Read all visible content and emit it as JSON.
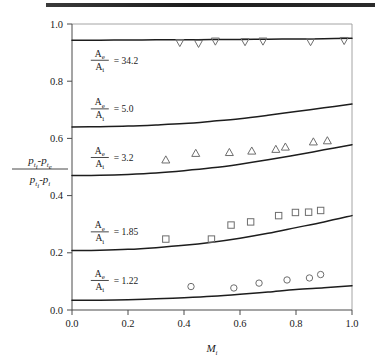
{
  "figure": {
    "name": "nozzle-total-pressure-loss-chart"
  },
  "chart_data": {
    "type": "line",
    "title": "",
    "xlabel": "M_i",
    "ylabel": "(p_ti - p_te) / (p_ti - p_i)",
    "xlim": [
      0.0,
      1.0
    ],
    "ylim": [
      0.0,
      1.0
    ],
    "grid": false,
    "legend_position": "inline-curve-labels",
    "xticks": [
      "0.0",
      "0.2",
      "0.4",
      "0.6",
      "0.8",
      "1.0"
    ],
    "xtick_values": [
      0.0,
      0.2,
      0.4,
      0.6,
      0.8,
      1.0
    ],
    "yticks": [
      "0.0",
      "0.2",
      "0.4",
      "0.6",
      "0.8",
      "1.0"
    ],
    "ytick_values": [
      0.0,
      0.2,
      0.4,
      0.6,
      0.8,
      1.0
    ],
    "series": [
      {
        "name": "Ae/Ai = 34.2",
        "label_numerator": "A",
        "label_num_sub": "e",
        "label_denominator": "A",
        "label_den_sub": "i",
        "label_value": "= 34.2",
        "ratio": "34.2",
        "label_x": 0.06,
        "label_y": 0.875,
        "curve_x": [
          0.0,
          0.1,
          0.2,
          0.3,
          0.4,
          0.5,
          0.6,
          0.7,
          0.8,
          0.9,
          1.0
        ],
        "curve_y": [
          0.943,
          0.9435,
          0.944,
          0.9445,
          0.945,
          0.9455,
          0.946,
          0.9468,
          0.9475,
          0.9485,
          0.95
        ],
        "marker": "triangle-down",
        "points_x": [
          0.385,
          0.452,
          0.512,
          0.618,
          0.682,
          0.852,
          0.972
        ],
        "points_y": [
          0.935,
          0.932,
          0.94,
          0.938,
          0.94,
          0.938,
          0.942
        ]
      },
      {
        "name": "Ae/Ai = 5.0",
        "label_numerator": "A",
        "label_num_sub": "e",
        "label_denominator": "A",
        "label_den_sub": "i",
        "label_value": "= 5.0",
        "ratio": "5.0",
        "label_x": 0.06,
        "label_y": 0.705,
        "curve_x": [
          0.0,
          0.1,
          0.2,
          0.3,
          0.4,
          0.5,
          0.6,
          0.7,
          0.8,
          0.9,
          1.0
        ],
        "curve_y": [
          0.64,
          0.641,
          0.643,
          0.647,
          0.652,
          0.66,
          0.669,
          0.681,
          0.694,
          0.707,
          0.72
        ],
        "marker": "none",
        "points_x": [],
        "points_y": []
      },
      {
        "name": "Ae/Ai = 3.2",
        "label_numerator": "A",
        "label_num_sub": "e",
        "label_denominator": "A",
        "label_den_sub": "i",
        "label_value": "= 3.2",
        "ratio": "3.2",
        "label_x": 0.06,
        "label_y": 0.535,
        "curve_x": [
          0.0,
          0.1,
          0.2,
          0.3,
          0.4,
          0.5,
          0.6,
          0.7,
          0.8,
          0.9,
          1.0
        ],
        "curve_y": [
          0.47,
          0.471,
          0.474,
          0.479,
          0.487,
          0.497,
          0.51,
          0.525,
          0.542,
          0.56,
          0.578
        ],
        "marker": "triangle-up",
        "points_x": [
          0.335,
          0.442,
          0.562,
          0.642,
          0.728,
          0.762,
          0.862,
          0.912
        ],
        "points_y": [
          0.525,
          0.548,
          0.551,
          0.556,
          0.562,
          0.57,
          0.588,
          0.592
        ]
      },
      {
        "name": "Ae/Ai = 1.85",
        "label_numerator": "A",
        "label_num_sub": "e",
        "label_denominator": "A",
        "label_den_sub": "i",
        "label_value": "= 1.85",
        "ratio": "1.85",
        "label_x": 0.06,
        "label_y": 0.275,
        "curve_x": [
          0.0,
          0.1,
          0.2,
          0.3,
          0.4,
          0.5,
          0.6,
          0.7,
          0.8,
          0.9,
          1.0
        ],
        "curve_y": [
          0.208,
          0.209,
          0.212,
          0.218,
          0.226,
          0.237,
          0.251,
          0.268,
          0.288,
          0.308,
          0.33
        ],
        "marker": "square",
        "points_x": [
          0.335,
          0.498,
          0.568,
          0.638,
          0.738,
          0.798,
          0.845,
          0.888
        ],
        "points_y": [
          0.248,
          0.248,
          0.297,
          0.308,
          0.33,
          0.341,
          0.342,
          0.348
        ]
      },
      {
        "name": "Ae/Ai = 1.22",
        "label_numerator": "A",
        "label_num_sub": "e",
        "label_denominator": "A",
        "label_den_sub": "i",
        "label_value": "= 1.22",
        "ratio": "1.22",
        "label_x": 0.06,
        "label_y": 0.105,
        "curve_x": [
          0.0,
          0.1,
          0.2,
          0.3,
          0.4,
          0.5,
          0.6,
          0.7,
          0.8,
          0.9,
          1.0
        ],
        "curve_y": [
          0.034,
          0.0345,
          0.036,
          0.039,
          0.043,
          0.048,
          0.055,
          0.063,
          0.072,
          0.078,
          0.085
        ],
        "marker": "circle",
        "points_x": [
          0.425,
          0.578,
          0.668,
          0.768,
          0.848,
          0.888
        ],
        "points_y": [
          0.082,
          0.077,
          0.094,
          0.105,
          0.112,
          0.124
        ]
      }
    ]
  },
  "axis_labels": {
    "y_numerator_p1": "p",
    "y_numerator_sub1": "t",
    "y_numerator_sub1b": "i",
    "y_numerator_minus": "-",
    "y_numerator_p2": "p",
    "y_numerator_sub2": "t",
    "y_numerator_sub2b": "e",
    "y_denominator_p1": "p",
    "y_denominator_sub1": "t",
    "y_denominator_sub1b": "i",
    "y_denominator_minus": "-",
    "y_denominator_p2": "p",
    "y_denominator_sub2": "i",
    "x_axis_main": "M",
    "x_axis_sub": "i"
  },
  "colors": {
    "curve": "#1d1d1d",
    "marker": "#6d6d6d",
    "axis": "#4a4a4a",
    "frame": "#9a9a9a",
    "background": "#ffffff",
    "top_rule": "#2b2b2b"
  }
}
